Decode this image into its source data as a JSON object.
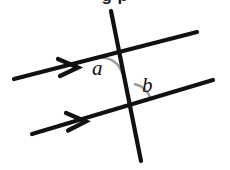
{
  "figure": {
    "type": "geometry-diagram",
    "background_color": "#ffffff",
    "line_color": "#111111",
    "arc_color": "#9a9a9a",
    "clipped_title": "g         p",
    "labels": {
      "angle_a": "a",
      "angle_b": "b"
    },
    "elements": {
      "upper_parallel_line": {
        "name": "upper-parallel-line",
        "x1": 14,
        "y1": 79,
        "x2": 197,
        "y2": 32,
        "arrow_marker": "single-chevron"
      },
      "lower_parallel_line": {
        "name": "lower-parallel-line",
        "x1": 32,
        "y1": 134,
        "x2": 213,
        "y2": 80,
        "arrow_marker": "single-chevron"
      },
      "transversal_line": {
        "name": "transversal-line",
        "x1": 111,
        "y1": 11,
        "x2": 141,
        "y2": 161
      },
      "intersection_upper": {
        "x": 118,
        "y": 53
      },
      "intersection_lower": {
        "x": 131,
        "y": 104
      },
      "arc_a": {
        "name": "angle-arc-a",
        "center_x": 118,
        "center_y": 53,
        "radius": 20
      },
      "arc_b": {
        "name": "angle-arc-b",
        "center_x": 131,
        "center_y": 104,
        "radius": 20
      }
    }
  }
}
